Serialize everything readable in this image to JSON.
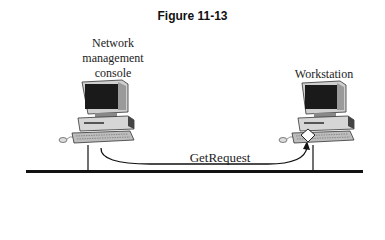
{
  "figure": {
    "title": "Figure 11-13"
  },
  "nodes": {
    "console": {
      "label_lines": [
        "Network",
        "management",
        "console"
      ]
    },
    "workstation": {
      "label": "Workstation"
    }
  },
  "message": {
    "label": "GetRequest"
  },
  "colors": {
    "line": "#111111",
    "monitor_body": "#d9d9d9",
    "screen": "#1a1a1a"
  }
}
